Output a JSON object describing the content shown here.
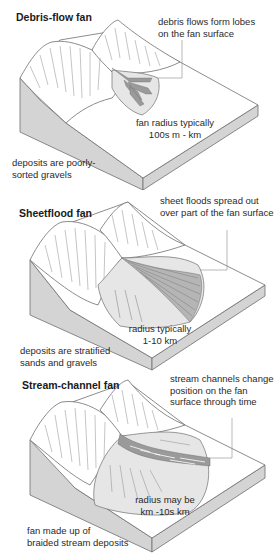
{
  "panels": [
    {
      "title": "Debris-flow fan",
      "callout": [
        "debris flows form lobes",
        "on the fan surface"
      ],
      "radius": [
        "fan radius typically",
        "100s m - km"
      ],
      "deposits": [
        "deposits are poorly-",
        "sorted gravels"
      ]
    },
    {
      "title": "Sheetflood fan",
      "callout": [
        "sheet floods spread out",
        "over part of the fan surface"
      ],
      "radius": [
        "radius typically",
        "1-10 km"
      ],
      "deposits": [
        "deposits are stratified",
        "sands and gravels"
      ]
    },
    {
      "title": "Stream-channel fan",
      "callout": [
        "stream channels change",
        "position on the fan",
        "surface through time"
      ],
      "radius": [
        "radius may be",
        "km -10s km"
      ],
      "deposits": [
        "fan made up of",
        "braided stream deposits"
      ]
    }
  ],
  "colors": {
    "outline": "#6e6e6e",
    "side_face": "#d4d4d4",
    "fan_fill": "#e6e6e6",
    "channel_fill": "#9a9a9a",
    "text": "#2a2a2a"
  }
}
